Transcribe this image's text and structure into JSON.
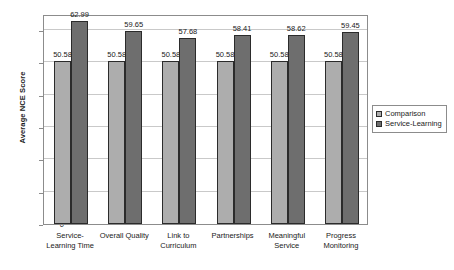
{
  "chart_data": {
    "type": "bar",
    "title": "",
    "xlabel": "",
    "ylabel": "Average NCE Score",
    "ylim": [
      0,
      65
    ],
    "yticks": [
      0,
      10,
      20,
      30,
      40,
      50,
      60
    ],
    "ytick_labels": [
      "0",
      "10",
      "20",
      "30",
      "40",
      "50",
      "60"
    ],
    "grid": true,
    "legend_position": "right",
    "categories": [
      "Service-\nLearning Time",
      "Overall Quality",
      "Link to\nCurriculum",
      "Partnerships",
      "Meaningful\nService",
      "Progress\nMonitoring"
    ],
    "series": [
      {
        "name": "Comparison",
        "color": "#adadad",
        "values": [
          50.58,
          50.58,
          50.58,
          50.58,
          50.58,
          50.58
        ],
        "labels": [
          "50.58",
          "50.58",
          "50.58",
          "50.58",
          "50.58",
          "50.58"
        ]
      },
      {
        "name": "Service-Learning",
        "color": "#6e6e6e",
        "values": [
          62.99,
          59.65,
          57.68,
          58.41,
          58.62,
          59.45
        ],
        "labels": [
          "62.99",
          "59.65",
          "57.68",
          "58.41",
          "58.62",
          "59.45"
        ]
      }
    ]
  },
  "legend": {
    "items": [
      {
        "label": "Comparison"
      },
      {
        "label": "Service-Learning"
      }
    ]
  }
}
